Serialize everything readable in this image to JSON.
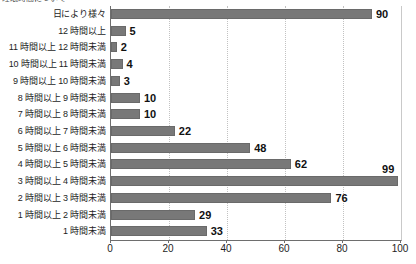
{
  "clipped_header": "睡眠時間について",
  "chart_data": {
    "type": "bar",
    "orientation": "horizontal",
    "title": "",
    "xlabel": "",
    "ylabel": "",
    "xlim": [
      0,
      100
    ],
    "xticks": [
      0,
      20,
      40,
      60,
      80,
      100
    ],
    "grid": true,
    "legend": false,
    "bar_color": "#787878",
    "categories": [
      "日により様々",
      "12 時間以上",
      "11 時間以上 12 時間未満",
      "10 時間以上 11 時間未満",
      "9 時間以上 10 時間未満",
      "8 時間以上 9 時間未満",
      "7 時間以上 8 時間未満",
      "6 時間以上 7 時間未満",
      "5 時間以上 6 時間未満",
      "4 時間以上 5 時間未満",
      "3 時間以上 4 時間未満",
      "2 時間以上 3 時間未満",
      "1 時間以上 2 時間未満",
      "1 時間未満"
    ],
    "values": [
      90,
      5,
      2,
      4,
      3,
      10,
      10,
      22,
      48,
      62,
      99,
      76,
      29,
      33
    ],
    "value_label_placement": [
      "right",
      "right",
      "right",
      "right",
      "right",
      "right",
      "right",
      "right",
      "right",
      "right",
      "above",
      "right",
      "right",
      "right"
    ]
  }
}
